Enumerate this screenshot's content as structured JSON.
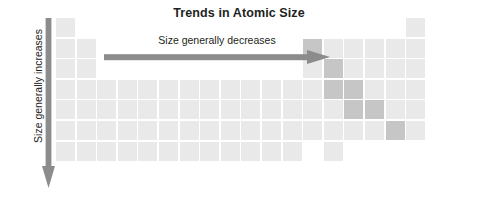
{
  "figure": {
    "title": "Trends in Atomic Size",
    "horizontal_label": "Size generally decreases",
    "vertical_label": "Size generally increases",
    "arrow_color": "#8c8c8c",
    "title_color": "#231f20",
    "background": "#ffffff"
  },
  "chart_data": {
    "type": "heatmap",
    "title": "Trends in Atomic Size",
    "xlabel": "Size generally decreases",
    "ylabel": "Size generally increases",
    "grid": false,
    "legend": "none",
    "columns": 18,
    "rows": 7,
    "cell_size": 19,
    "cell_gap": 1.6,
    "origin_x": 56,
    "origin_y": 18,
    "categories": [
      "group 1",
      "group 2",
      "group 3",
      "group 4",
      "group 5",
      "group 6",
      "group 7",
      "group 8",
      "group 9",
      "group 10",
      "group 11",
      "group 12",
      "group 13",
      "group 14",
      "group 15",
      "group 16",
      "group 17",
      "group 18"
    ],
    "series": [
      {
        "name": "period 1",
        "values": [
          1,
          0,
          0,
          0,
          0,
          0,
          0,
          0,
          0,
          0,
          0,
          0,
          0,
          0,
          0,
          0,
          0,
          1
        ]
      },
      {
        "name": "period 2",
        "values": [
          1,
          1,
          0,
          0,
          0,
          0,
          0,
          0,
          0,
          0,
          0,
          0,
          2,
          1,
          1,
          1,
          1,
          1
        ]
      },
      {
        "name": "period 3",
        "values": [
          1,
          1,
          0,
          0,
          0,
          0,
          0,
          0,
          0,
          0,
          0,
          0,
          1,
          2,
          1,
          1,
          1,
          1
        ]
      },
      {
        "name": "period 4",
        "values": [
          1,
          1,
          1,
          1,
          1,
          1,
          1,
          1,
          1,
          1,
          1,
          1,
          1,
          2,
          2,
          1,
          1,
          1
        ]
      },
      {
        "name": "period 5",
        "values": [
          1,
          1,
          1,
          1,
          1,
          1,
          1,
          1,
          1,
          1,
          1,
          1,
          1,
          1,
          2,
          2,
          1,
          1
        ]
      },
      {
        "name": "period 6",
        "values": [
          1,
          1,
          1,
          1,
          1,
          1,
          1,
          1,
          1,
          1,
          1,
          1,
          1,
          1,
          1,
          1,
          2,
          1
        ]
      },
      {
        "name": "period 7",
        "values": [
          1,
          1,
          1,
          1,
          1,
          1,
          1,
          1,
          1,
          1,
          1,
          1,
          0,
          1,
          0,
          0,
          0,
          0
        ]
      }
    ],
    "value_colors": {
      "0": "transparent",
      "1": "#e9e9e9",
      "2": "#c6c6c6"
    },
    "value_labels": {
      "0": "empty",
      "1": "element cell",
      "2": "metalloid cell"
    }
  }
}
